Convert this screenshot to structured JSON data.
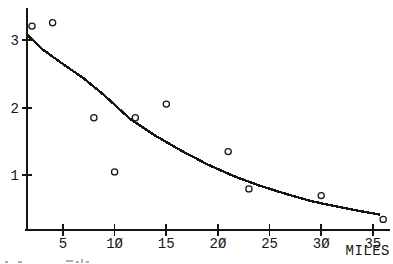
{
  "figure": {
    "background": "#ffffff",
    "ink": "#151515"
  },
  "chart_data": {
    "type": "scatter",
    "title": "",
    "xlabel": "MILES",
    "ylabel": "",
    "grid": false,
    "legend": false,
    "x_axis": {
      "tick_values": [
        5,
        10,
        15,
        20,
        25,
        30,
        35
      ],
      "tick_labels": [
        "5",
        "1Ø",
        "15",
        "2Ø",
        "25",
        "3Ø",
        "35"
      ],
      "range": [
        1.3,
        36.7
      ]
    },
    "y_axis": {
      "tick_values": [
        1,
        2,
        3
      ],
      "tick_labels": [
        "1",
        "2",
        "3"
      ],
      "range": [
        0.19,
        3.47
      ]
    },
    "series": [
      {
        "name": "observed-points",
        "type": "scatter",
        "marker": "open-circle",
        "points": [
          [
            2,
            3.2
          ],
          [
            4,
            3.25
          ],
          [
            8,
            1.85
          ],
          [
            10,
            1.05
          ],
          [
            12,
            1.85
          ],
          [
            15,
            2.05
          ],
          [
            21,
            1.35
          ],
          [
            23,
            0.8
          ],
          [
            30,
            0.7
          ],
          [
            36,
            0.35
          ]
        ]
      },
      {
        "name": "fitted-curve",
        "type": "line",
        "points": [
          [
            1.5,
            3.08
          ],
          [
            3,
            2.86
          ],
          [
            5,
            2.64
          ],
          [
            7,
            2.43
          ],
          [
            9,
            2.18
          ],
          [
            11.5,
            1.83
          ],
          [
            14,
            1.58
          ],
          [
            16.5,
            1.36
          ],
          [
            19,
            1.16
          ],
          [
            21.5,
            0.99
          ],
          [
            24,
            0.85
          ],
          [
            26.5,
            0.73
          ],
          [
            29,
            0.62
          ],
          [
            31.5,
            0.54
          ],
          [
            33.5,
            0.48
          ],
          [
            35.7,
            0.42
          ]
        ]
      }
    ]
  },
  "layout_px": {
    "x_origin": 11.3,
    "px_per_x": 10.33,
    "y_at_value1": 175.3,
    "px_per_y": 67.8,
    "x_axis_y": 230,
    "y_axis_x": 27,
    "x_axis_span": [
      25,
      390
    ],
    "y_axis_span": [
      8,
      231
    ],
    "x_tick_half": 6,
    "y_tick_half": 5,
    "x_label_baseline": 248,
    "y_label_right": 19,
    "y_label_baseline_offset": 5,
    "marker_radius": 3.1,
    "axis_width": 2.4,
    "curve_width": 2.4,
    "tick_width": 1.6
  },
  "caption_fragments": [
    [
      5,
      261,
      3,
      2
    ],
    [
      18,
      261,
      4,
      2
    ],
    [
      66,
      260,
      7,
      2
    ],
    [
      76,
      261,
      3,
      2
    ],
    [
      81,
      259,
      2,
      4
    ],
    [
      86,
      261,
      3,
      2
    ]
  ]
}
